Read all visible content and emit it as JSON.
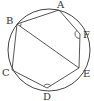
{
  "diagram": {
    "type": "inscribed-hexagon-in-circle",
    "stroke_color": "#444444",
    "circle": {
      "cx": 49,
      "cy": 50,
      "r": 41
    },
    "points": {
      "A": {
        "x": 59,
        "y": 10,
        "label": "A",
        "lx": 57,
        "ly": 8
      },
      "B": {
        "x": 17,
        "y": 24,
        "label": "B",
        "lx": 6,
        "ly": 24
      },
      "F": {
        "x": 80,
        "y": 34,
        "label": "F",
        "lx": 83,
        "ly": 38
      },
      "E": {
        "x": 79,
        "y": 68,
        "label": "E",
        "lx": 83,
        "ly": 77
      },
      "D": {
        "x": 47,
        "y": 88,
        "label": "D",
        "lx": 43,
        "ly": 100
      },
      "C": {
        "x": 12,
        "y": 70,
        "label": "C",
        "lx": 2,
        "ly": 76
      }
    },
    "polygon_order": [
      "A",
      "F",
      "E",
      "D",
      "C",
      "B"
    ],
    "diagonals": [
      [
        "B",
        "E"
      ]
    ],
    "marked_angles": [
      "B",
      "F",
      "D"
    ]
  }
}
